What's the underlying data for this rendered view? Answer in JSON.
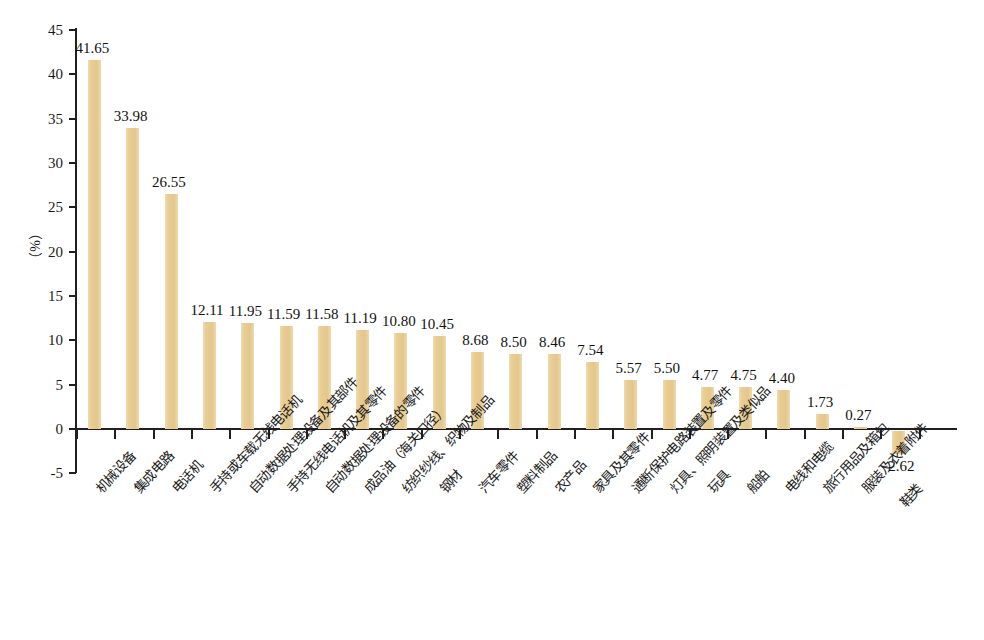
{
  "chart_data": {
    "type": "bar",
    "title": "",
    "subtitle": "",
    "xlabel": "",
    "ylabel": "（%）",
    "ylim": [
      -5,
      45
    ],
    "ytick_interval": 5,
    "yticks": [
      "45",
      "40",
      "35",
      "30",
      "25",
      "20",
      "15",
      "10",
      "5",
      "0",
      "-5"
    ],
    "ytick_values": [
      45,
      40,
      35,
      30,
      25,
      20,
      15,
      10,
      5,
      0,
      -5
    ],
    "grid": false,
    "legend": null,
    "bar_color": "#e9cd93",
    "axis_color": "#231f20",
    "categories": [
      "机械设备",
      "集成电路",
      "电话机",
      "手持或车载无线电话机",
      "自动数据处理设备及其部件",
      "手持无线电话机及其零件",
      "自动数据处理设备的零件",
      "成品油（海关口径）",
      "纺织纱线、织物及制品",
      "钢材",
      "汽车零件",
      "塑料制品",
      "农产品",
      "家具及其零件",
      "通断保护电路装置及零件",
      "灯具、照明装置及类似品",
      "玩具",
      "船舶",
      "电线和电缆",
      "旅行用品及箱包",
      "服装及衣着附件",
      "鞋类"
    ],
    "values": [
      41.65,
      33.98,
      26.55,
      12.11,
      11.95,
      11.59,
      11.58,
      11.19,
      10.8,
      10.45,
      8.68,
      8.5,
      8.46,
      7.54,
      5.57,
      5.5,
      4.77,
      4.75,
      4.4,
      1.73,
      0.27,
      -2.62
    ],
    "value_labels": [
      "41.65",
      "33.98",
      "26.55",
      "12.11",
      "11.95",
      "11.59",
      "11.58",
      "11.19",
      "10.80",
      "10.45",
      "8.68",
      "8.50",
      "8.46",
      "7.54",
      "5.57",
      "5.50",
      "4.77",
      "4.75",
      "4.40",
      "1.73",
      "0.27",
      "−2.62"
    ]
  }
}
